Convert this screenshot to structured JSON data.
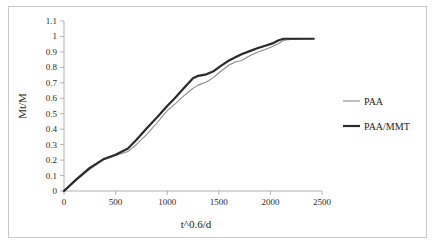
{
  "chart_data": {
    "type": "line",
    "title": "",
    "xlabel": "t^0.6/d",
    "ylabel": "Mt/M",
    "xlim": [
      0,
      2500
    ],
    "ylim": [
      0,
      1.1
    ],
    "xticks": [
      0,
      500,
      1000,
      1500,
      2000,
      2500
    ],
    "xtick_labels": [
      "0",
      "500",
      "1000",
      "1500",
      "2000",
      "2500"
    ],
    "yticks": [
      0,
      0.1,
      0.2,
      0.3,
      0.4,
      0.5,
      0.6,
      0.7,
      0.8,
      0.9,
      1,
      1.1
    ],
    "ytick_labels": [
      "0",
      "0.1",
      "0.2",
      "0.3",
      "0.4",
      "0.5",
      "0.6",
      "0.7",
      "0.8",
      "0.9",
      "1",
      "1.1"
    ],
    "grid": false,
    "legend_position": "right",
    "series": [
      {
        "name": "PAA",
        "color": "#8a8a8a",
        "line_width": 1.1,
        "x": [
          0,
          120,
          250,
          380,
          500,
          620,
          700,
          800,
          900,
          1000,
          1080,
          1160,
          1250,
          1300,
          1380,
          1450,
          1520,
          1600,
          1660,
          1720,
          1800,
          1880,
          1950,
          2020,
          2080,
          2130,
          2200,
          2280,
          2420
        ],
        "y": [
          0,
          0.07,
          0.14,
          0.2,
          0.23,
          0.255,
          0.3,
          0.365,
          0.44,
          0.52,
          0.565,
          0.615,
          0.665,
          0.685,
          0.705,
          0.735,
          0.775,
          0.815,
          0.835,
          0.845,
          0.875,
          0.9,
          0.915,
          0.935,
          0.955,
          0.975,
          0.98,
          0.982,
          0.985
        ]
      },
      {
        "name": "PAA/MMT",
        "color": "#2a2a2a",
        "line_width": 2.2,
        "x": [
          0,
          120,
          250,
          380,
          500,
          620,
          700,
          800,
          900,
          1000,
          1080,
          1160,
          1250,
          1300,
          1380,
          1450,
          1520,
          1600,
          1660,
          1720,
          1800,
          1880,
          1950,
          2020,
          2080,
          2130,
          2200,
          2280,
          2420
        ],
        "y": [
          0,
          0.075,
          0.15,
          0.205,
          0.235,
          0.275,
          0.33,
          0.405,
          0.475,
          0.55,
          0.605,
          0.665,
          0.73,
          0.745,
          0.755,
          0.775,
          0.81,
          0.845,
          0.865,
          0.885,
          0.905,
          0.925,
          0.94,
          0.955,
          0.975,
          0.985,
          0.985,
          0.985,
          0.985
        ]
      }
    ],
    "annotations": []
  },
  "legend": {
    "entries": [
      {
        "label": "PAA"
      },
      {
        "label": "PAA/MMT"
      }
    ]
  },
  "colors": {
    "axis": "#a0a0a0",
    "frame": "#c9c9c9",
    "text": "#1a1a1a",
    "series_paa": "#8a8a8a",
    "series_paammt": "#2a2a2a"
  }
}
